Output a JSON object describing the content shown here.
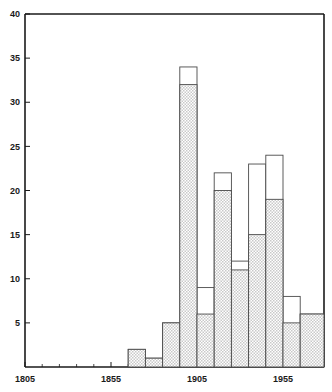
{
  "chart_data": {
    "type": "bar",
    "title": "",
    "subtitle": "",
    "xlabel": "",
    "ylabel": "",
    "xlim": [
      1805,
      1965
    ],
    "ylim": [
      0,
      40
    ],
    "bin_width": 10,
    "grid": false,
    "legend_position": "none",
    "stacked": true,
    "categories": [
      "1805",
      "1815",
      "1825",
      "1835",
      "1845",
      "1855",
      "1865",
      "1875",
      "1885",
      "1895",
      "1905",
      "1915",
      "1925",
      "1935",
      "1945",
      "1955"
    ],
    "bin_starts": [
      1805,
      1815,
      1825,
      1835,
      1845,
      1855,
      1865,
      1875,
      1885,
      1895,
      1905,
      1915,
      1925,
      1935,
      1945,
      1955
    ],
    "series": [
      {
        "name": "shaded",
        "values": [
          0,
          0,
          0,
          0,
          0,
          0,
          2,
          1,
          5,
          32,
          6,
          20,
          11,
          15,
          19,
          5
        ]
      },
      {
        "name": "total",
        "values": [
          0,
          0,
          0,
          0,
          0,
          0,
          2,
          1,
          5,
          34,
          9,
          22,
          12,
          23,
          24,
          8
        ]
      }
    ],
    "values": [
      0,
      0,
      0,
      0,
      0,
      0,
      2,
      1,
      5,
      34,
      9,
      22,
      12,
      23,
      24,
      8
    ],
    "trailing_segment": {
      "bin_start": 1965,
      "value": 6,
      "note": "partial open bar at right edge"
    },
    "x_tick_labels": [
      "1805",
      "1855",
      "1905",
      "1955"
    ],
    "x_tick_values": [
      1805,
      1855,
      1905,
      1955
    ],
    "x_minor_tick_step": 10,
    "y_tick_labels": [
      "5",
      "10",
      "15",
      "20",
      "25",
      "30",
      "35",
      "40"
    ],
    "y_tick_values": [
      5,
      10,
      15,
      20,
      25,
      30,
      35,
      40
    ],
    "colors": {
      "axis": "#1a1a1a",
      "bar_outline": "#4a4a4a",
      "bar_fill_shaded": "#d8d8d8",
      "bar_fill_open": "#ffffff",
      "background": "#ffffff"
    }
  }
}
